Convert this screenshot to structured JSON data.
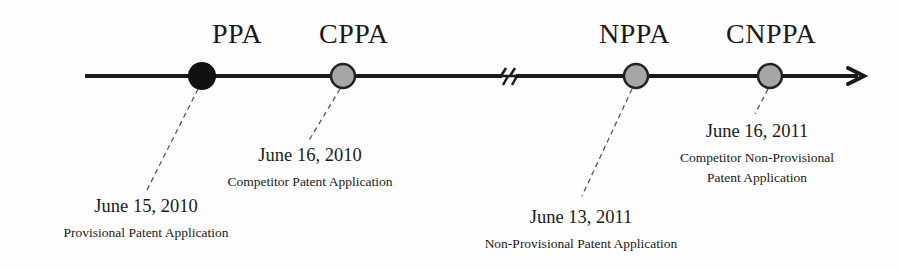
{
  "diagram": {
    "type": "timeline",
    "colors": {
      "line": "#1a1a1a",
      "primary_marker": "#111111",
      "secondary_marker": "#a6a6a6",
      "marker_border": "#222222",
      "connector": "#555555"
    },
    "axis": {
      "has_break": true,
      "arrow": "right"
    },
    "events": [
      {
        "abbr": "PPA",
        "marker": "filled-black",
        "date": "June 15, 2010",
        "description": [
          "Provisional Patent Application"
        ]
      },
      {
        "abbr": "CPPA",
        "marker": "filled-gray",
        "date": "June 16, 2010",
        "description": [
          "Competitor Patent Application"
        ]
      },
      {
        "abbr": "NPPA",
        "marker": "filled-gray",
        "date": "June 13, 2011",
        "description": [
          "Non-Provisional Patent Application"
        ]
      },
      {
        "abbr": "CNPPA",
        "marker": "filled-gray",
        "date": "June 16, 2011",
        "description": [
          "Competitor Non-Provisional",
          "Patent Application"
        ]
      }
    ]
  }
}
